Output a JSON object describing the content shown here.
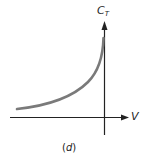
{
  "diagram": {
    "y_axis_label": "C",
    "y_axis_label_sub": "T",
    "x_axis_label": "V",
    "caption_open": "(",
    "caption_letter": "d",
    "caption_close": ")",
    "curve_color": "#7a7a7a",
    "axis_color": "#222222"
  }
}
